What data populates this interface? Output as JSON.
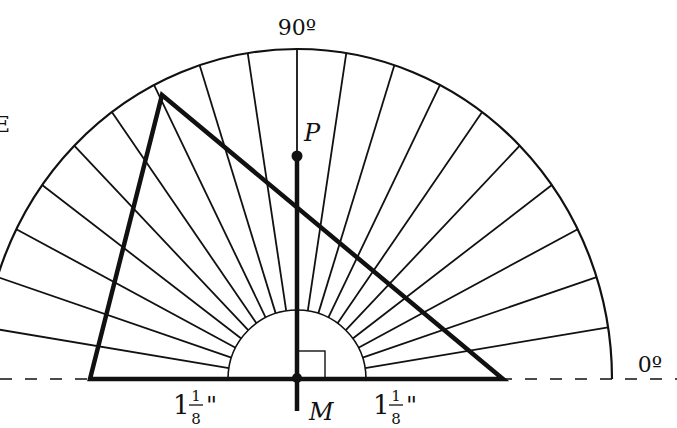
{
  "diagram": {
    "type": "protractor-triangle",
    "protractor": {
      "start_angle_deg": 0,
      "end_angle_deg": 180,
      "ray_spacing_deg": 9,
      "label_top": "90º",
      "label_right": "0º"
    },
    "points": {
      "P": {
        "label": "P"
      },
      "M": {
        "label": "M"
      }
    },
    "segments": {
      "left_half_label": {
        "whole": "1",
        "numerator": "1",
        "denominator": "8",
        "unit": "\""
      },
      "right_half_label": {
        "whole": "1",
        "numerator": "1",
        "denominator": "8",
        "unit": "\""
      }
    },
    "annotations": {
      "right_angle_at": "M",
      "perpendicular": "PM"
    },
    "colors": {
      "stroke": "#111111",
      "background": "#ffffff"
    }
  }
}
